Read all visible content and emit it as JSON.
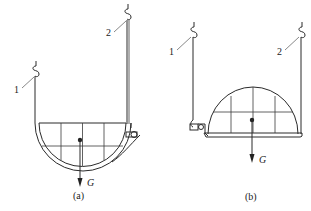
{
  "figures": [
    {
      "id": "a",
      "caption": "(a)",
      "hook_labels": [
        "1",
        "2"
      ],
      "weight_label": "G",
      "shape": "hemisphere-bowl-open-up"
    },
    {
      "id": "b",
      "caption": "(b)",
      "hook_labels": [
        "1",
        "2"
      ],
      "weight_label": "G",
      "shape": "hemisphere-dome-open-down"
    }
  ],
  "colors": {
    "line": "#2a2a2a",
    "background": "#ffffff"
  }
}
